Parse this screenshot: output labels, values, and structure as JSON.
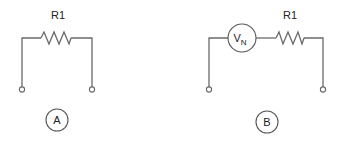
{
  "diagram": {
    "type": "circuit-schematic",
    "colors": {
      "wire": "#6a6a6a",
      "text": "#222222",
      "background": "#ffffff"
    },
    "circuits": [
      {
        "id": "A",
        "label": "A",
        "components": [
          {
            "type": "resistor",
            "name": "R1",
            "label": "R1"
          }
        ],
        "terminals": 2
      },
      {
        "id": "B",
        "label": "B",
        "components": [
          {
            "type": "voltage-source",
            "name": "VN",
            "label_main": "V",
            "label_sub": "N"
          },
          {
            "type": "resistor",
            "name": "R1",
            "label": "R1"
          }
        ],
        "terminals": 2
      }
    ]
  }
}
